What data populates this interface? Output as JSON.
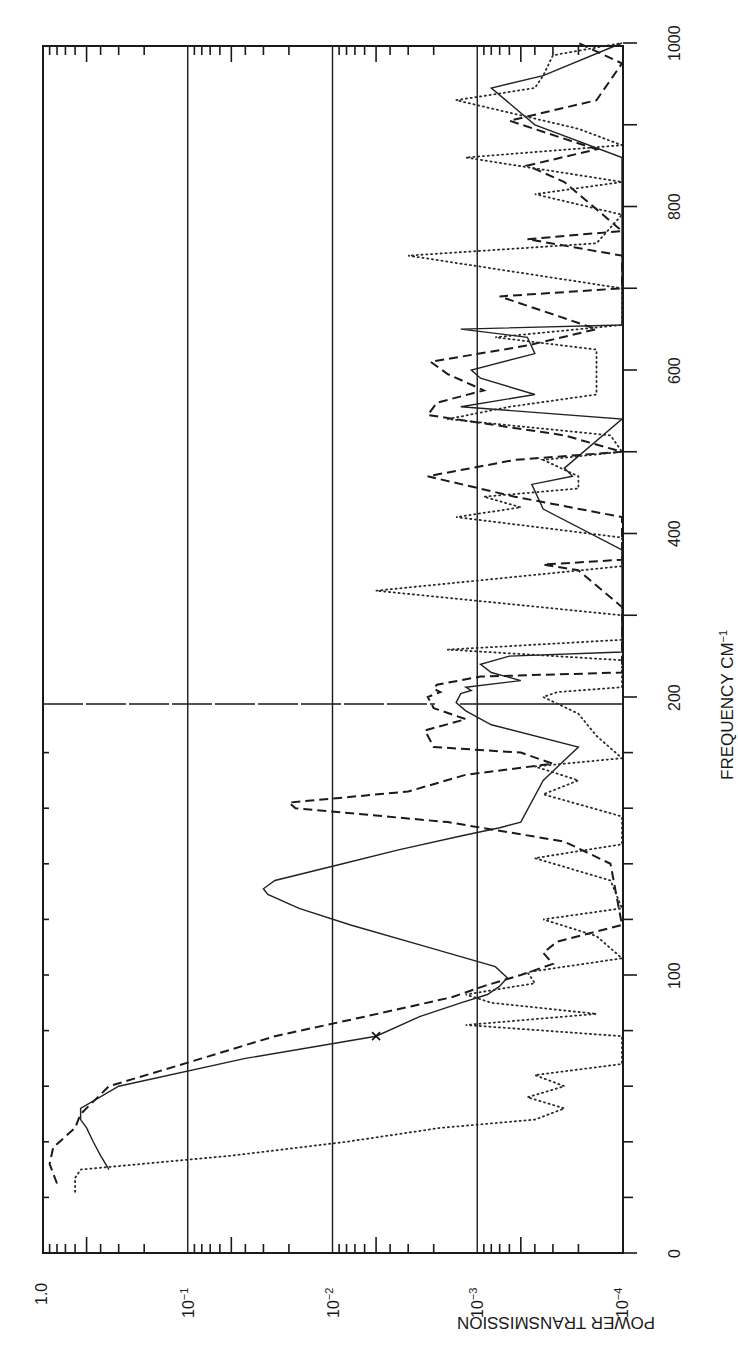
{
  "chart_data": {
    "type": "line",
    "title": "",
    "orientation": "rotated 90° (frequency axis vertical on right, transmission axis horizontal at bottom)",
    "xlabel": "FREQUENCY CM⁻¹",
    "ylabel": "POWER TRANSMISSION",
    "x_scale": "broken linear: 0–200 expanded, 200–1000 compressed",
    "xlim": [
      0,
      1000
    ],
    "x_ticks": [
      {
        "value": 0,
        "label": "0"
      },
      {
        "value": 100,
        "label": "100"
      },
      {
        "value": 200,
        "label": "200"
      },
      {
        "value": 400,
        "label": "400"
      },
      {
        "value": 600,
        "label": "600"
      },
      {
        "value": 800,
        "label": "800"
      },
      {
        "value": 1000,
        "label": "1000"
      }
    ],
    "y_scale": "log",
    "ylim": [
      0.0001,
      1.0
    ],
    "y_ticks": [
      {
        "value": 1.0,
        "label": "1.0",
        "base": "1.0",
        "exp": ""
      },
      {
        "value": 0.1,
        "label": "10^-1",
        "base": "10",
        "exp": "−1"
      },
      {
        "value": 0.01,
        "label": "10^-2",
        "base": "10",
        "exp": "−2"
      },
      {
        "value": 0.001,
        "label": "10^-3",
        "base": "10",
        "exp": "−3"
      },
      {
        "value": 0.0001,
        "label": "10^-4",
        "base": "10",
        "exp": "−4"
      }
    ],
    "grid": {
      "y_major": true,
      "x_break_line_at": 200
    },
    "legend": null,
    "annotations": [
      {
        "type": "x-marker",
        "series": "solid",
        "x": 78,
        "y": 0.005
      }
    ],
    "series": [
      {
        "name": "solid",
        "style": "solid",
        "points": [
          [
            30,
            0.35
          ],
          [
            35,
            0.4
          ],
          [
            40,
            0.45
          ],
          [
            45,
            0.5
          ],
          [
            48,
            0.55
          ],
          [
            52,
            0.55
          ],
          [
            60,
            0.3
          ],
          [
            70,
            0.04
          ],
          [
            78,
            0.005
          ],
          [
            85,
            0.0025
          ],
          [
            90,
            0.0013
          ],
          [
            93,
            0.00085
          ],
          [
            96,
            0.0007
          ],
          [
            99,
            0.00062
          ],
          [
            103,
            0.00075
          ],
          [
            110,
            0.0022
          ],
          [
            118,
            0.0075
          ],
          [
            124,
            0.017
          ],
          [
            129,
            0.028
          ],
          [
            131,
            0.03
          ],
          [
            134,
            0.025
          ],
          [
            140,
            0.0085
          ],
          [
            145,
            0.0035
          ],
          [
            150,
            0.0013
          ],
          [
            153,
            0.0007
          ],
          [
            155,
            0.0005
          ],
          [
            170,
            0.00035
          ],
          [
            182,
            0.0002
          ],
          [
            190,
            0.0008
          ],
          [
            195,
            0.0012
          ],
          [
            198,
            0.0014
          ],
          [
            204,
            0.0013
          ],
          [
            208,
            0.0011
          ],
          [
            212,
            0.0012
          ],
          [
            220,
            0.0005
          ],
          [
            230,
            0.0008
          ],
          [
            240,
            0.00095
          ],
          [
            250,
            0.0006
          ],
          [
            255,
            0.0001
          ],
          [
            380,
            0.0001
          ],
          [
            430,
            0.00035
          ],
          [
            460,
            0.00042
          ],
          [
            470,
            0.00022
          ],
          [
            480,
            0.00025
          ],
          [
            540,
            0.0001
          ],
          [
            555,
            0.0013
          ],
          [
            570,
            0.0004
          ],
          [
            590,
            0.00095
          ],
          [
            600,
            0.0011
          ],
          [
            620,
            0.0004
          ],
          [
            640,
            0.00045
          ],
          [
            650,
            0.0013
          ],
          [
            655,
            0.0001
          ],
          [
            860,
            0.0001
          ],
          [
            900,
            0.0004
          ],
          [
            945,
            0.0008
          ],
          [
            960,
            0.00035
          ],
          [
            1000,
            0.0001
          ]
        ]
      },
      {
        "name": "dashed",
        "style": "dashed",
        "points": [
          [
            25,
            0.8
          ],
          [
            32,
            0.9
          ],
          [
            38,
            0.85
          ],
          [
            45,
            0.6
          ],
          [
            50,
            0.55
          ],
          [
            60,
            0.35
          ],
          [
            70,
            0.08
          ],
          [
            78,
            0.025
          ],
          [
            85,
            0.006
          ],
          [
            92,
            0.0015
          ],
          [
            96,
            0.0009
          ],
          [
            100,
            0.0005
          ],
          [
            104,
            0.0003
          ],
          [
            108,
            0.00035
          ],
          [
            112,
            0.00028
          ],
          [
            118,
            0.0001
          ],
          [
            140,
            0.00012
          ],
          [
            148,
            0.00025
          ],
          [
            155,
            0.0016
          ],
          [
            160,
            0.018
          ],
          [
            162,
            0.02
          ],
          [
            166,
            0.003
          ],
          [
            172,
            0.0012
          ],
          [
            176,
            0.0003
          ],
          [
            180,
            0.0005
          ],
          [
            182,
            0.002
          ],
          [
            188,
            0.0023
          ],
          [
            192,
            0.0012
          ],
          [
            196,
            0.002
          ],
          [
            200,
            0.0022
          ],
          [
            206,
            0.0018
          ],
          [
            210,
            0.002
          ],
          [
            215,
            0.0019
          ],
          [
            225,
            0.00095
          ],
          [
            230,
            0.0001
          ],
          [
            310,
            0.0001
          ],
          [
            355,
            0.0002
          ],
          [
            362,
            0.00035
          ],
          [
            368,
            0.0001
          ],
          [
            420,
            0.0001
          ],
          [
            445,
            0.00055
          ],
          [
            470,
            0.0022
          ],
          [
            490,
            0.00055
          ],
          [
            500,
            0.0001
          ],
          [
            520,
            0.00025
          ],
          [
            545,
            0.0022
          ],
          [
            560,
            0.0019
          ],
          [
            575,
            0.0009
          ],
          [
            595,
            0.0016
          ],
          [
            610,
            0.0021
          ],
          [
            630,
            0.00045
          ],
          [
            650,
            0.00015
          ],
          [
            690,
            0.0007
          ],
          [
            700,
            0.0001
          ],
          [
            740,
            0.0001
          ],
          [
            760,
            0.00045
          ],
          [
            770,
            0.0001
          ],
          [
            830,
            0.00025
          ],
          [
            850,
            0.00045
          ],
          [
            870,
            0.00015
          ],
          [
            905,
            0.0006
          ],
          [
            930,
            0.00015
          ],
          [
            975,
            0.0001
          ],
          [
            1000,
            0.0002
          ]
        ]
      },
      {
        "name": "dotted",
        "style": "dotted",
        "points": [
          [
            22,
            0.6
          ],
          [
            27,
            0.6
          ],
          [
            30,
            0.55
          ],
          [
            35,
            0.05
          ],
          [
            40,
            0.008
          ],
          [
            45,
            0.0018
          ],
          [
            48,
            0.0004
          ],
          [
            52,
            0.00025
          ],
          [
            56,
            0.00045
          ],
          [
            60,
            0.00025
          ],
          [
            64,
            0.0004
          ],
          [
            68,
            0.0001
          ],
          [
            78,
            0.0001
          ],
          [
            82,
            0.0012
          ],
          [
            86,
            0.00015
          ],
          [
            90,
            0.0008
          ],
          [
            93,
            0.0012
          ],
          [
            97,
            0.0004
          ],
          [
            101,
            0.00045
          ],
          [
            106,
            0.0001
          ],
          [
            114,
            0.00015
          ],
          [
            120,
            0.00035
          ],
          [
            124,
            0.0001
          ],
          [
            134,
            0.00012
          ],
          [
            142,
            0.0004
          ],
          [
            147,
            0.0001
          ],
          [
            157,
            0.0001
          ],
          [
            165,
            0.00035
          ],
          [
            170,
            0.0002
          ],
          [
            175,
            0.0004
          ],
          [
            178,
            0.0001
          ],
          [
            186,
            0.00015
          ],
          [
            194,
            0.0002
          ],
          [
            200,
            0.00035
          ],
          [
            206,
            0.00028
          ],
          [
            212,
            0.0001
          ],
          [
            245,
            0.0001
          ],
          [
            258,
            0.0016
          ],
          [
            270,
            0.0001
          ],
          [
            300,
            0.0001
          ],
          [
            330,
            0.005
          ],
          [
            360,
            0.0001
          ],
          [
            395,
            0.0001
          ],
          [
            420,
            0.0014
          ],
          [
            432,
            0.0005
          ],
          [
            445,
            0.0009
          ],
          [
            455,
            0.0002
          ],
          [
            470,
            0.0002
          ],
          [
            490,
            0.00035
          ],
          [
            500,
            0.0001
          ],
          [
            520,
            0.00012
          ],
          [
            540,
            0.0016
          ],
          [
            555,
            0.0006
          ],
          [
            570,
            0.00015
          ],
          [
            625,
            0.00015
          ],
          [
            640,
            0.00075
          ],
          [
            655,
            0.0001
          ],
          [
            700,
            0.0001
          ],
          [
            740,
            0.003
          ],
          [
            755,
            0.00015
          ],
          [
            790,
            0.0001
          ],
          [
            815,
            0.0004
          ],
          [
            830,
            0.0001
          ],
          [
            860,
            0.0012
          ],
          [
            875,
            0.0001
          ],
          [
            895,
            0.0002
          ],
          [
            930,
            0.0014
          ],
          [
            945,
            0.0004
          ],
          [
            960,
            0.00035
          ],
          [
            985,
            0.0003
          ],
          [
            1000,
            0.0001
          ]
        ]
      }
    ]
  },
  "axis_labels": {
    "frequency": "FREQUENCY  CM",
    "frequency_exp": "−1",
    "transmission": "POWER TRANSMISSION"
  }
}
